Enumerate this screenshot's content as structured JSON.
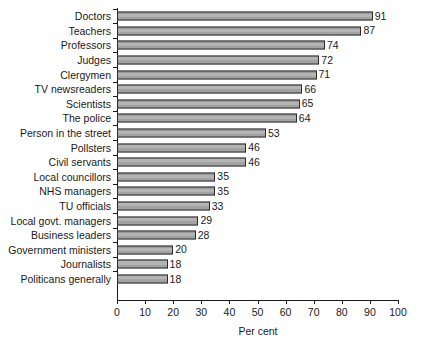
{
  "chart_data": {
    "type": "bar",
    "orientation": "horizontal",
    "title": "",
    "subtitle": "",
    "xlabel": "Per cent",
    "ylabel": "",
    "xlim": [
      0,
      100
    ],
    "xticks": [
      0,
      10,
      20,
      30,
      40,
      50,
      60,
      70,
      80,
      90,
      100
    ],
    "xtick_labels": [
      "0",
      "10",
      "20",
      "30",
      "40",
      "50",
      "60",
      "70",
      "80",
      "90",
      "100"
    ],
    "grid": false,
    "legend": false,
    "legend_position": "none",
    "data_labels": true,
    "categories": [
      "Doctors",
      "Teachers",
      "Professors",
      "Judges",
      "Clergymen",
      "TV newsreaders",
      "Scientists",
      "The police",
      "Person in the street",
      "Pollsters",
      "Civil servants",
      "Local councillors",
      "NHS managers",
      "TU officials",
      "Local govt. managers",
      "Business leaders",
      "Government ministers",
      "Journalists",
      "Politicans generally"
    ],
    "values": [
      91,
      87,
      74,
      72,
      71,
      66,
      65,
      64,
      53,
      46,
      46,
      35,
      35,
      33,
      29,
      28,
      20,
      18,
      18
    ],
    "value_labels": [
      "91",
      "87",
      "74",
      "72",
      "71",
      "66",
      "65",
      "64",
      "53",
      "46",
      "46",
      "35",
      "35",
      "33",
      "29",
      "28",
      "20",
      "18",
      "18"
    ],
    "colors": {
      "bar_fill": "#a9a9a9",
      "bar_edge": "#2b2b2b",
      "axis": "#1a1a1a",
      "text": "#1a1a1a",
      "background": "#ffffff"
    }
  }
}
